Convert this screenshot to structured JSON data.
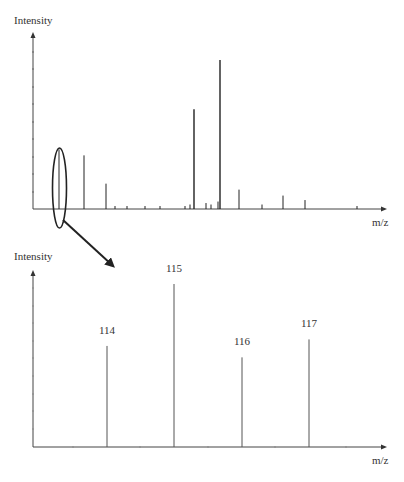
{
  "chart_data": [
    {
      "type": "bar",
      "title": "Full mass spectrum",
      "xlabel": "m/z",
      "ylabel": "Intensity",
      "grid": false,
      "note": "Stick spectrum; no numeric ticks labeled. Values are relative heights (0-100, tallest = 100).",
      "peaks_px": [
        {
          "x": 59,
          "rel": 40
        },
        {
          "x": 84,
          "rel": 36
        },
        {
          "x": 106,
          "rel": 17
        },
        {
          "x": 115,
          "rel": 2
        },
        {
          "x": 127,
          "rel": 2
        },
        {
          "x": 145,
          "rel": 2
        },
        {
          "x": 160,
          "rel": 2
        },
        {
          "x": 185,
          "rel": 2
        },
        {
          "x": 190,
          "rel": 3
        },
        {
          "x": 194,
          "rel": 67
        },
        {
          "x": 206,
          "rel": 4
        },
        {
          "x": 211,
          "rel": 3
        },
        {
          "x": 218,
          "rel": 5
        },
        {
          "x": 220,
          "rel": 100
        },
        {
          "x": 239,
          "rel": 13
        },
        {
          "x": 262,
          "rel": 3
        },
        {
          "x": 283,
          "rel": 9
        },
        {
          "x": 305,
          "rel": 6
        },
        {
          "x": 357,
          "rel": 2
        }
      ],
      "highlight": {
        "label": "zoomed region (ellipse)",
        "x_center": 59
      }
    },
    {
      "type": "bar",
      "title": "Zoomed isotope cluster",
      "xlabel": "m/z",
      "ylabel": "Intensity",
      "grid": false,
      "categories": [
        "114",
        "115",
        "116",
        "117"
      ],
      "values": [
        62,
        100,
        55,
        66
      ],
      "note": "Relative heights estimated from pixels; tallest (115) = 100."
    }
  ],
  "top_chart": {
    "ylabel": "Intensity",
    "xlabel": "m/z"
  },
  "bottom_chart": {
    "ylabel": "Intensity",
    "xlabel": "m/z",
    "peak_labels": [
      "114",
      "115",
      "116",
      "117"
    ]
  }
}
